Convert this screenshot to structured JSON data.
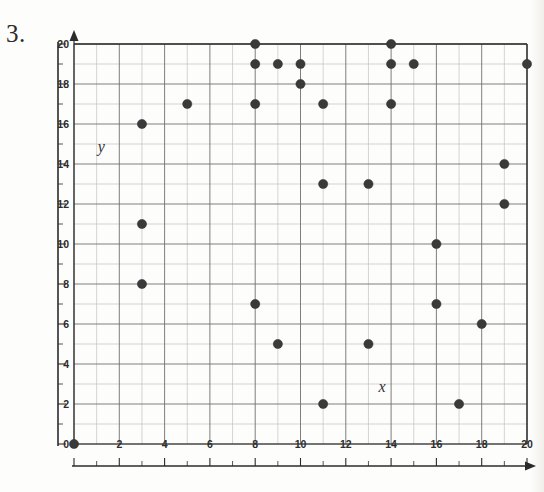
{
  "problem": {
    "number": "3."
  },
  "chart_data": {
    "type": "scatter",
    "title": "",
    "xlabel": "x",
    "ylabel": "y",
    "xlim": [
      0,
      20
    ],
    "ylim": [
      0,
      20
    ],
    "grid": true,
    "grid_step": 1,
    "tick_step": 2,
    "legend": "none",
    "x_ticks": [
      0,
      2,
      4,
      6,
      8,
      10,
      12,
      14,
      16,
      18,
      20
    ],
    "y_ticks": [
      0,
      2,
      4,
      6,
      8,
      10,
      12,
      14,
      16,
      18,
      20
    ],
    "x_tick_labels": [
      "0",
      "2",
      "4",
      "6",
      "8",
      "10",
      "12",
      "14",
      "16",
      "18",
      "20"
    ],
    "y_tick_labels": [
      "0",
      "2",
      "4",
      "6",
      "8",
      "10",
      "12",
      "14",
      "16",
      "18",
      "20"
    ],
    "points": [
      {
        "x": 0,
        "y": 0
      },
      {
        "x": 3,
        "y": 8
      },
      {
        "x": 3,
        "y": 11
      },
      {
        "x": 3,
        "y": 16
      },
      {
        "x": 5,
        "y": 17
      },
      {
        "x": 8,
        "y": 7
      },
      {
        "x": 8,
        "y": 17
      },
      {
        "x": 8,
        "y": 19
      },
      {
        "x": 8,
        "y": 20
      },
      {
        "x": 9,
        "y": 19
      },
      {
        "x": 9,
        "y": 5
      },
      {
        "x": 10,
        "y": 19
      },
      {
        "x": 10,
        "y": 18
      },
      {
        "x": 11,
        "y": 13
      },
      {
        "x": 11,
        "y": 2
      },
      {
        "x": 11,
        "y": 17
      },
      {
        "x": 13,
        "y": 5
      },
      {
        "x": 13,
        "y": 13
      },
      {
        "x": 14,
        "y": 17
      },
      {
        "x": 14,
        "y": 19
      },
      {
        "x": 14,
        "y": 20
      },
      {
        "x": 15,
        "y": 19
      },
      {
        "x": 16,
        "y": 10
      },
      {
        "x": 16,
        "y": 7
      },
      {
        "x": 17,
        "y": 2
      },
      {
        "x": 18,
        "y": 6
      },
      {
        "x": 19,
        "y": 12
      },
      {
        "x": 19,
        "y": 14
      },
      {
        "x": 20,
        "y": 19
      }
    ]
  },
  "style": {
    "point_color": "#3a3a3a",
    "axis_color": "#2b2b2b",
    "grid_minor_color": "#b9b9b9",
    "grid_major_color": "#6f6f6f",
    "background": "#ffffff"
  }
}
